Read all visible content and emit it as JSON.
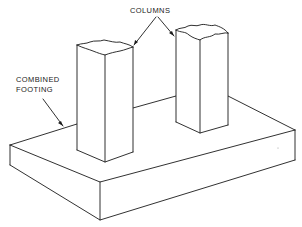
{
  "figure": {
    "labels": {
      "columns": "COLUMNS",
      "footing_line1": "COMBINED",
      "footing_line2": "FOOTING"
    },
    "colors": {
      "line": "#1a1a1a",
      "background": "#ffffff",
      "text": "#222222"
    }
  }
}
